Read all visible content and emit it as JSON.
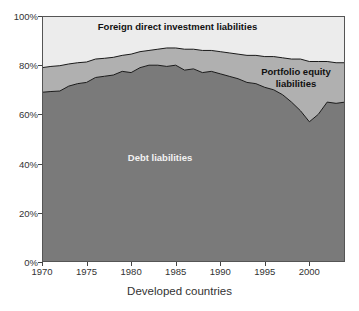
{
  "axis": {
    "x_title": "Developed countries",
    "x_ticks": [
      {
        "value": 1970,
        "label": "1970"
      },
      {
        "value": 1975,
        "label": "1975"
      },
      {
        "value": 1980,
        "label": "1980"
      },
      {
        "value": 1985,
        "label": "1985"
      },
      {
        "value": 1990,
        "label": "1990"
      },
      {
        "value": 1995,
        "label": "1995"
      },
      {
        "value": 2000,
        "label": "2000"
      }
    ],
    "y_ticks": [
      {
        "value": 0,
        "label": "0%"
      },
      {
        "value": 20,
        "label": "20%"
      },
      {
        "value": 40,
        "label": "40%"
      },
      {
        "value": 60,
        "label": "60%"
      },
      {
        "value": 80,
        "label": "80%"
      },
      {
        "value": 100,
        "label": "100%"
      }
    ]
  },
  "labels": {
    "fdi": "Foreign direct investment liabilities",
    "portfolio": "Portfolio equity\nliabilities",
    "debt": "Debt liabilities"
  },
  "colors": {
    "debt": "#7a7a7a",
    "portfolio": "#b0b0b0",
    "fdi": "#ececec",
    "outline": "#1a1a1a",
    "plot_border": "#555555",
    "text": "#333333",
    "debt_label_text": "#f2f2f2"
  },
  "chart_data": {
    "type": "area",
    "stacked": "percent",
    "title": "",
    "subtitle": "",
    "xlabel": "Developed countries",
    "ylabel": "",
    "xlim": [
      1970,
      2004
    ],
    "ylim": [
      0,
      100
    ],
    "grid": false,
    "legend": "inline-area-labels",
    "x": [
      1970,
      1971,
      1972,
      1973,
      1974,
      1975,
      1976,
      1977,
      1978,
      1979,
      1980,
      1981,
      1982,
      1983,
      1984,
      1985,
      1986,
      1987,
      1988,
      1989,
      1990,
      1991,
      1992,
      1993,
      1994,
      1995,
      1996,
      1997,
      1998,
      1999,
      2000,
      2001,
      2002,
      2003,
      2004
    ],
    "series": [
      {
        "name": "Debt liabilities",
        "values": [
          69.0,
          69.3,
          69.5,
          71.5,
          72.5,
          73.0,
          75.0,
          75.5,
          76.0,
          77.5,
          77.0,
          79.0,
          80.0,
          80.0,
          79.5,
          80.0,
          78.0,
          78.5,
          77.0,
          77.5,
          76.5,
          75.5,
          74.5,
          73.0,
          72.5,
          71.0,
          70.0,
          68.0,
          65.0,
          61.5,
          57.0,
          60.0,
          65.0,
          64.5,
          65.0
        ]
      },
      {
        "name": "Portfolio equity liabilities",
        "values": [
          10.0,
          10.2,
          10.3,
          9.0,
          8.5,
          8.3,
          7.5,
          7.3,
          7.2,
          6.5,
          7.5,
          6.5,
          6.0,
          6.5,
          7.5,
          7.0,
          8.5,
          8.0,
          9.0,
          8.5,
          9.0,
          9.5,
          10.0,
          11.0,
          11.5,
          12.5,
          13.5,
          15.0,
          17.5,
          21.0,
          24.5,
          21.5,
          16.5,
          16.5,
          16.0
        ]
      },
      {
        "name": "Foreign direct investment liabilities",
        "values": [
          21.0,
          20.5,
          20.2,
          19.5,
          19.0,
          18.7,
          17.5,
          17.2,
          16.8,
          16.0,
          15.5,
          14.5,
          14.0,
          13.5,
          13.0,
          13.0,
          13.5,
          13.5,
          14.0,
          14.0,
          14.5,
          15.0,
          15.5,
          16.0,
          16.0,
          16.5,
          16.5,
          17.0,
          17.5,
          17.5,
          18.5,
          18.5,
          18.5,
          19.0,
          19.0
        ]
      }
    ],
    "boundaries": {
      "debt_top": [
        69.0,
        69.3,
        69.5,
        71.5,
        72.5,
        73.0,
        75.0,
        75.5,
        76.0,
        77.5,
        77.0,
        79.0,
        80.0,
        80.0,
        79.5,
        80.0,
        78.0,
        78.5,
        77.0,
        77.5,
        76.5,
        75.5,
        74.5,
        73.0,
        72.5,
        71.0,
        70.0,
        68.0,
        65.0,
        61.5,
        57.0,
        60.0,
        65.0,
        64.5,
        65.0
      ],
      "portfolio_top": [
        79.0,
        79.5,
        79.8,
        80.5,
        81.0,
        81.3,
        82.5,
        82.8,
        83.2,
        84.0,
        84.5,
        85.5,
        86.0,
        86.5,
        87.0,
        87.0,
        86.5,
        86.5,
        86.0,
        86.0,
        85.5,
        85.0,
        84.5,
        84.0,
        84.0,
        83.5,
        83.5,
        83.0,
        82.5,
        82.5,
        81.5,
        81.5,
        81.5,
        81.0,
        81.0
      ]
    }
  }
}
